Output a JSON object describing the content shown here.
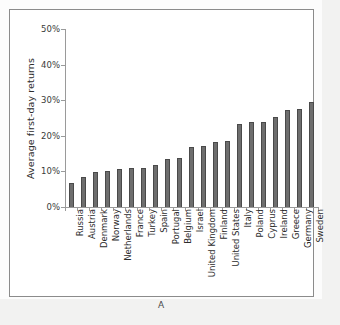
{
  "figure": {
    "caption": "A",
    "panel_label": "A"
  },
  "chart_data": {
    "type": "bar",
    "title": "",
    "xlabel": "",
    "ylabel": "Average first-day returns",
    "ylim": [
      0,
      50
    ],
    "ytick_labels": [
      "0%",
      "10%",
      "20%",
      "30%",
      "40%",
      "50%"
    ],
    "ytick_values": [
      0,
      10,
      20,
      30,
      40,
      50
    ],
    "grid": false,
    "legend": "none",
    "unit": "percent",
    "bar_color": "#6e6e6e",
    "bar_edge_color": "#4a4a4a",
    "categories": [
      "Russia",
      "Austria",
      "Denmark",
      "Norway",
      "Netherlands",
      "France",
      "Turkey",
      "Spain",
      "Portugal",
      "Belgium",
      "Israel",
      "United Kingdom",
      "Finland",
      "United States",
      "Italy",
      "Poland",
      "Cyprus",
      "Ireland",
      "Greece",
      "Germany",
      "Sweden"
    ],
    "values": [
      6.7,
      8.3,
      9.8,
      10.1,
      10.7,
      11.0,
      11.0,
      11.8,
      13.6,
      13.9,
      16.8,
      17.1,
      18.2,
      18.5,
      23.2,
      23.8,
      23.9,
      25.3,
      27.2,
      27.4,
      29.5
    ]
  }
}
